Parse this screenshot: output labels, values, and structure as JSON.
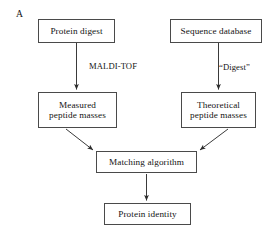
{
  "figure": {
    "panel_label": "A",
    "background_color": "#ffffff",
    "line_color": "#4a4a4a",
    "text_color": "#141414"
  },
  "nodes": {
    "protein_digest": "Protein digest",
    "sequence_database": "Sequence database",
    "measured_peptide_masses": "Measured\npeptide masses",
    "theoretical_peptide_masses": "Theoretical\npeptide masses",
    "matching_algorithm": "Matching algorithm",
    "protein_identity": "Protein identity"
  },
  "edge_labels": {
    "maldi_tof": "MALDI-TOF",
    "digest": "“Digest”"
  },
  "diagram_data": {
    "type": "flowchart",
    "flow": [
      {
        "from": "protein_digest",
        "to": "measured_peptide_masses",
        "label": "MALDI-TOF",
        "direction": "down"
      },
      {
        "from": "sequence_database",
        "to": "theoretical_peptide_masses",
        "label": "“Digest”",
        "direction": "down"
      },
      {
        "from": "measured_peptide_masses",
        "to": "matching_algorithm",
        "label": "",
        "direction": "diagonal-down-right"
      },
      {
        "from": "theoretical_peptide_masses",
        "to": "matching_algorithm",
        "label": "",
        "direction": "diagonal-down-left"
      },
      {
        "from": "matching_algorithm",
        "to": "protein_identity",
        "label": "",
        "direction": "down"
      }
    ]
  }
}
